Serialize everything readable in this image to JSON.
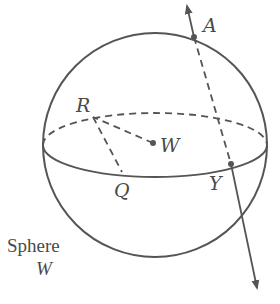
{
  "diagram": {
    "title": "Sphere W",
    "caption_line1": "Sphere",
    "caption_line2": "W",
    "colors": {
      "stroke": "#555555",
      "text": "#4a4a4a",
      "background": "#ffffff"
    },
    "points": {
      "A": {
        "label": "A",
        "on": "sphere surface (top)"
      },
      "R": {
        "label": "R",
        "on": "equator (back)"
      },
      "W": {
        "label": "W",
        "on": "center"
      },
      "Q": {
        "label": "Q",
        "on": "equator (front)"
      },
      "Y": {
        "label": "Y",
        "on": "equator (front right)"
      }
    },
    "segments": [
      {
        "from": "W",
        "to": "R",
        "style": "dashed"
      },
      {
        "from": "R",
        "to": "Q",
        "style": "dashed"
      },
      {
        "from": "A",
        "to": "Y",
        "style": "dashed"
      }
    ],
    "rays": [
      {
        "from": "Y",
        "through": "A",
        "style": "solid, arrow beyond A"
      },
      {
        "from": "A",
        "through": "Y",
        "style": "solid, arrow beyond Y"
      }
    ]
  }
}
